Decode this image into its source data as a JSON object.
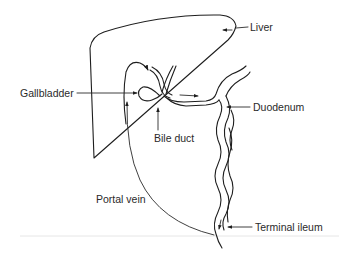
{
  "diagram": {
    "type": "anatomical-schematic",
    "labels": {
      "liver": "Liver",
      "gallbladder": "Gallbladder",
      "bile_duct": "Bile duct",
      "duodenum": "Duodenum",
      "portal_vein": "Portal vein",
      "terminal_ileum": "Terminal ileum"
    },
    "structures": [
      {
        "id": "liver",
        "label": "Liver"
      },
      {
        "id": "gallbladder",
        "label": "Gallbladder"
      },
      {
        "id": "bile-duct",
        "label": "Bile duct"
      },
      {
        "id": "duodenum",
        "label": "Duodenum"
      },
      {
        "id": "small-intestine",
        "label": ""
      },
      {
        "id": "terminal-ileum",
        "label": "Terminal ileum"
      },
      {
        "id": "portal-vein",
        "label": "Portal vein"
      }
    ],
    "flow": [
      "Liver",
      "Gallbladder",
      "Bile duct",
      "Duodenum",
      "Terminal ileum",
      "Portal vein",
      "Liver"
    ],
    "colors": {
      "line": "#1e1e1e",
      "text": "#2a2a2a",
      "background": "#ffffff"
    }
  }
}
